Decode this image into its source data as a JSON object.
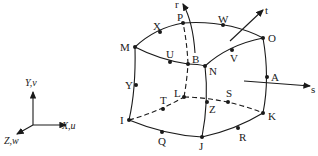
{
  "figure": {
    "global_axes": {
      "y_label": "Y,v",
      "x_label": "X,u",
      "z_label": "Z,w"
    },
    "local_axes": {
      "r_label": "r",
      "s_label": "s",
      "t_label": "t"
    },
    "nodes": {
      "M": "M",
      "X": "X",
      "P": "P",
      "W": "W",
      "O": "O",
      "U": "U",
      "B": "B",
      "N": "N",
      "V": "V",
      "A": "A",
      "Y": "Y",
      "I": "I",
      "T": "T",
      "L": "L",
      "Z": "Z",
      "S": "S",
      "K": "K",
      "Q": "Q",
      "J": "J",
      "R": "R"
    },
    "colors": {
      "line": "#1a1a1a",
      "background": "#ffffff"
    }
  }
}
